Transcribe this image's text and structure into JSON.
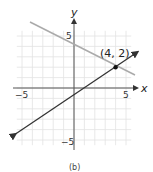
{
  "chart_data": {
    "type": "line",
    "title": "",
    "caption": "(b)",
    "xlabel": "x",
    "ylabel": "y",
    "xlim": [
      -5,
      5
    ],
    "ylim": [
      -5,
      5
    ],
    "grid": true,
    "x_tick_labels": [
      "−5",
      "5"
    ],
    "y_tick_labels": [
      "5",
      "−5"
    ],
    "series": [
      {
        "name": "gray line",
        "equation": "y = -0.5x + 4",
        "color": "#aaaaaa",
        "x": [
          -5,
          6
        ],
        "y": [
          6.5,
          1
        ]
      },
      {
        "name": "dark line",
        "equation": "y = 0.75x - 1",
        "color": "#333333",
        "x": [
          -6,
          6
        ],
        "y": [
          -5.5,
          3.5
        ]
      }
    ],
    "annotations": [
      {
        "text": "(4, 2)",
        "x": 4,
        "y": 2,
        "marker": "point"
      }
    ]
  }
}
